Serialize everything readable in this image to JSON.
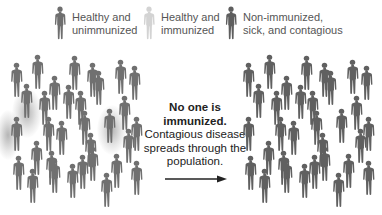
{
  "legend": [
    {
      "label": "Healthy and\nunimmunized",
      "color": "#6e6e6e",
      "icon": "person-icon"
    },
    {
      "label": "Healthy and\nimmunized",
      "color": "#d3d3d3",
      "icon": "person-icon"
    },
    {
      "label": "Non-immunized,\nsick, and contagious",
      "color": "#5e5e5e",
      "icon": "person-icon"
    }
  ],
  "caption": {
    "bold": "No one is immunized.",
    "text": "Contagious disease spreads through the population."
  },
  "colors": {
    "healthy_unimmunized": "#707070",
    "immunized": "#d3d3d3",
    "sick": "#606060"
  },
  "left_population": {
    "description": "Before: mostly healthy unimmunized, a few sick",
    "sick_count": 3
  },
  "right_population": {
    "description": "After: all sick and contagious"
  }
}
